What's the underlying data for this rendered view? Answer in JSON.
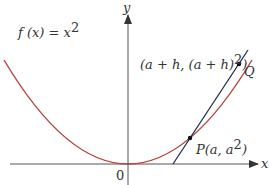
{
  "diagram": {
    "function_label": "f (x) = x²",
    "function_label_parts": {
      "fx": "f (x) = x",
      "sup": "2"
    },
    "axis_x_label": "x",
    "axis_y_label": "y",
    "origin_label": "0",
    "point_p_label": "P(a, a²)",
    "point_p_parts": {
      "main": "P(a, a",
      "sup": "2",
      "end": ")"
    },
    "point_q_label": "Q",
    "point_q_coords_label": "(a + h,  (a + h)²)",
    "point_q_coords_parts": {
      "main": "(a + h,  (a + h)",
      "sup": "2",
      "end": ")"
    },
    "colors": {
      "curve": "#b5443c",
      "secant": "#1f2d4d",
      "axes": "#555555",
      "points": "#111111"
    }
  }
}
